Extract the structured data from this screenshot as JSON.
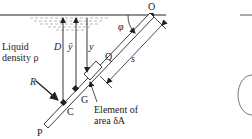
{
  "figure": {
    "labels": {
      "O": "O",
      "phi": "φ",
      "D": "D",
      "ybar": "ȳ",
      "y": "y",
      "Q": "Q",
      "s": "s",
      "G": "G",
      "C": "C",
      "P": "P",
      "R": "R",
      "liquid_line1": "Liquid",
      "liquid_line2": "density ρ",
      "element_line1": "Element of",
      "element_line2": "area δA"
    },
    "colors": {
      "ink": "#222222",
      "water_hatch": "#8a8a8a",
      "ellipse": "#666666"
    }
  }
}
